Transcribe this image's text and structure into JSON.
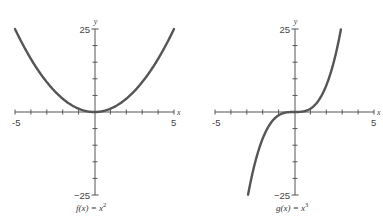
{
  "chart_data": [
    {
      "type": "line",
      "title": "",
      "caption": "f(x) = x²",
      "caption_base": "f(x) = x",
      "caption_exp": "2",
      "function": "x^2",
      "xlabel": "x",
      "ylabel": "y",
      "xlim": [
        -5,
        5
      ],
      "ylim": [
        -25,
        25
      ],
      "x_tick_labels": [
        "-5",
        "5"
      ],
      "y_tick_labels": [
        "25",
        "−25"
      ],
      "x_ticks": [
        -5,
        -4,
        -3,
        -2,
        -1,
        1,
        2,
        3,
        4,
        5
      ],
      "y_ticks": [
        -25,
        -20,
        -15,
        -10,
        -5,
        5,
        10,
        15,
        20,
        25
      ],
      "grid": false,
      "x": [
        -5,
        -4,
        -3,
        -2,
        -1,
        0,
        1,
        2,
        3,
        4,
        5
      ],
      "y": [
        25,
        16,
        9,
        4,
        1,
        0,
        1,
        4,
        9,
        16,
        25
      ],
      "line_color": "#555555"
    },
    {
      "type": "line",
      "title": "",
      "caption": "g(x) = x³",
      "caption_base": "g(x) = x",
      "caption_exp": "3",
      "function": "x^3",
      "xlabel": "x",
      "ylabel": "y",
      "xlim": [
        -5,
        5
      ],
      "ylim": [
        -25,
        25
      ],
      "x_tick_labels": [
        "-5",
        "5"
      ],
      "y_tick_labels": [
        "25",
        "−25"
      ],
      "x_ticks": [
        -5,
        -4,
        -3,
        -2,
        -1,
        1,
        2,
        3,
        4,
        5
      ],
      "y_ticks": [
        -25,
        -20,
        -15,
        -10,
        -5,
        5,
        10,
        15,
        20,
        25
      ],
      "grid": false,
      "x": [
        -2.92,
        -2.5,
        -2,
        -1.5,
        -1,
        -0.5,
        0,
        0.5,
        1,
        1.5,
        2,
        2.5,
        2.92
      ],
      "y": [
        -25,
        -15.6,
        -8,
        -3.4,
        -1,
        -0.1,
        0,
        0.1,
        1,
        3.4,
        8,
        15.6,
        25
      ],
      "line_color": "#555555"
    }
  ]
}
